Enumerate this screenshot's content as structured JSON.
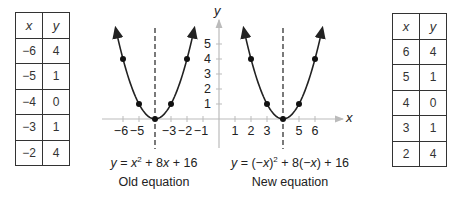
{
  "left_table": {
    "headers": [
      "x",
      "y"
    ],
    "rows": [
      [
        "−6",
        "4"
      ],
      [
        "−5",
        "1"
      ],
      [
        "−4",
        "0"
      ],
      [
        "−3",
        "1"
      ],
      [
        "−2",
        "4"
      ]
    ]
  },
  "right_table": {
    "headers": [
      "x",
      "y"
    ],
    "rows": [
      [
        "6",
        "4"
      ],
      [
        "5",
        "1"
      ],
      [
        "4",
        "0"
      ],
      [
        "3",
        "1"
      ],
      [
        "2",
        "4"
      ]
    ]
  },
  "axes": {
    "x_label": "x",
    "y_label": "y",
    "x_ticks": [
      "−6",
      "−5",
      "−3",
      "−2",
      "−1",
      "1",
      "2",
      "3",
      "5",
      "6"
    ],
    "y_ticks": [
      "1",
      "2",
      "3",
      "4",
      "5"
    ]
  },
  "old": {
    "equation_parts": [
      "y",
      " = ",
      "x",
      "2",
      " + 8",
      "x",
      " + 16"
    ],
    "caption": "Old equation",
    "axis_of_symmetry": -4,
    "points": [
      [
        -6,
        4
      ],
      [
        -5,
        1
      ],
      [
        -4,
        0
      ],
      [
        -3,
        1
      ],
      [
        -2,
        4
      ]
    ]
  },
  "new": {
    "equation_parts": [
      "y",
      " = (−",
      "x",
      ")",
      "2",
      " + 8(−",
      "x",
      ") + 16"
    ],
    "caption": "New equation",
    "axis_of_symmetry": 4,
    "points": [
      [
        6,
        4
      ],
      [
        5,
        1
      ],
      [
        4,
        0
      ],
      [
        3,
        1
      ],
      [
        2,
        4
      ]
    ]
  },
  "chart_data": {
    "type": "line",
    "title": "",
    "xlabel": "x",
    "ylabel": "y",
    "xlim": [
      -6.5,
      7.5
    ],
    "ylim": [
      -1.5,
      6.5
    ],
    "grid": false,
    "series": [
      {
        "name": "y = x^2 + 8x + 16 (Old equation)",
        "x": [
          -6,
          -5,
          -4,
          -3,
          -2
        ],
        "y": [
          4,
          1,
          0,
          1,
          4
        ],
        "vertex": [
          -4,
          0
        ],
        "axis_of_symmetry": "x = -4"
      },
      {
        "name": "y = (-x)^2 + 8(-x) + 16 (New equation)",
        "x": [
          2,
          3,
          4,
          5,
          6
        ],
        "y": [
          4,
          1,
          0,
          1,
          4
        ],
        "vertex": [
          4,
          0
        ],
        "axis_of_symmetry": "x = 4"
      }
    ]
  }
}
